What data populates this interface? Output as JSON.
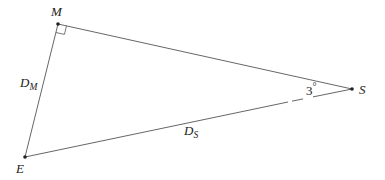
{
  "diagram": {
    "type": "triangle",
    "points": {
      "M": {
        "label": "M",
        "x": 58,
        "y": 24
      },
      "S": {
        "label": "S",
        "x": 352,
        "y": 89
      },
      "E": {
        "label": "E",
        "x": 25,
        "y": 157
      }
    },
    "sides": {
      "EM": {
        "label_main": "D",
        "label_sub": "M"
      },
      "ES": {
        "label_main": "D",
        "label_sub": "S"
      }
    },
    "angle_S": {
      "value": "3",
      "unit": "°"
    },
    "right_angle_at": "M",
    "colors": {
      "line": "#555555",
      "point": "#222222",
      "text": "#222222"
    }
  }
}
